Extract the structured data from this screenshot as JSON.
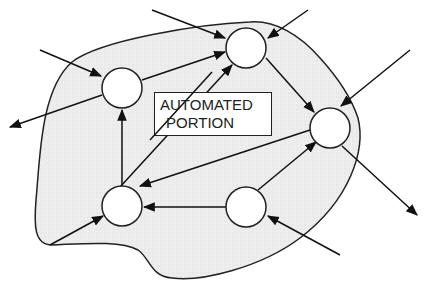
{
  "diagram": {
    "label": {
      "line1": "AUTOMATED",
      "line2": "PORTION"
    },
    "colors": {
      "region_fill": "#ececec",
      "stroke": "#222222",
      "node_fill": "#ffffff"
    },
    "nodes": [
      {
        "id": "n1",
        "cx": 122,
        "cy": 88,
        "r": 20
      },
      {
        "id": "n2",
        "cx": 246,
        "cy": 48,
        "r": 20
      },
      {
        "id": "n3",
        "cx": 330,
        "cy": 128,
        "r": 20
      },
      {
        "id": "n4",
        "cx": 122,
        "cy": 206,
        "r": 20
      },
      {
        "id": "n5",
        "cx": 246,
        "cy": 207,
        "r": 20
      }
    ],
    "edges": [
      {
        "from": "n1",
        "to": "n2"
      },
      {
        "from": "n4",
        "to": "n1"
      },
      {
        "from": "n4",
        "to": "n2"
      },
      {
        "from": "n2",
        "to": "n3"
      },
      {
        "from": "n3",
        "to": "n4"
      },
      {
        "from": "n5",
        "to": "n4"
      },
      {
        "from": "n5",
        "to": "n3"
      }
    ],
    "external_inputs": [
      {
        "to": "n1",
        "from_point": [
          40,
          50
        ]
      },
      {
        "to": "n2",
        "from_point": [
          152,
          10
        ]
      },
      {
        "to": "n2",
        "from_point": [
          308,
          10
        ]
      },
      {
        "to": "n3",
        "from_point": [
          410,
          50
        ]
      },
      {
        "to": "n4",
        "from_point": [
          50,
          245
        ]
      },
      {
        "to": "n5",
        "from_point": [
          340,
          255
        ]
      }
    ],
    "external_outputs": [
      {
        "from": "n1",
        "to_point": [
          8,
          128
        ]
      },
      {
        "from": "n3",
        "to_point": [
          418,
          216
        ]
      }
    ]
  }
}
